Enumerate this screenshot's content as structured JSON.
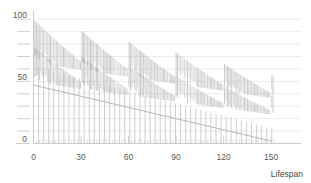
{
  "chart_data": {
    "type": "bar",
    "title": "",
    "subtitle": "",
    "xlabel": "Lifespan",
    "ylabel": "",
    "xlim": [
      0,
      160
    ],
    "ylim": [
      0,
      105
    ],
    "grid": true,
    "grid_axis": "y",
    "legend": false,
    "legend_position": "none",
    "annotations": [],
    "x_ticks_major": [
      0,
      30,
      60,
      90,
      120,
      150
    ],
    "x_tick_labels": [
      "0",
      "30",
      "60",
      "90",
      "120",
      "150"
    ],
    "x_ticks_minor_step": 2,
    "y_ticks_major": [
      0,
      50,
      100
    ],
    "y_tick_labels": [
      "0",
      "50",
      "100"
    ],
    "y_ticks_minor": [
      10,
      20,
      30,
      40,
      60,
      70,
      80,
      90
    ],
    "y_gridline_step": 10,
    "colors": {
      "bar": "#b9b9bd",
      "bar_dense": "#a9a9ae",
      "trend_line": "#b0b0b4",
      "gridline": "#e4e4e8",
      "axis": "#c8c8cc",
      "tick_label": "#5a5a5a",
      "axis_title": "#4a4a4a",
      "background": "#ffffff"
    },
    "series": [
      {
        "name": "upper-band",
        "kind": "vertical-sticks",
        "description": "Dense sawtooth band of vertical sticks with tops declining from 100 toward 55 across the lifespan axis, resetting every 30 units.",
        "sawtooth_period": 30,
        "top_start": 100,
        "top_end": 55,
        "baseline_start": 72,
        "baseline_end": 40,
        "stick_step": 0.9
      },
      {
        "name": "middle-band",
        "kind": "vertical-sticks",
        "description": "Second dense sawtooth band of vertical sticks with tops declining from 78 toward 38, resetting every 30 units.",
        "sawtooth_period": 30,
        "top_start": 78,
        "top_end": 38,
        "baseline_start": 55,
        "baseline_end": 26,
        "stick_step": 0.9
      },
      {
        "name": "lower-sparse-bars",
        "kind": "vertical-sticks",
        "description": "Widely spaced vertical bars rising from the zero baseline, tops declining from about 62 at x=0 to about 12 at x=150.",
        "spacing": 3.2,
        "top_start": 62,
        "top_end": 12,
        "baseline": 0
      },
      {
        "name": "trend-line",
        "kind": "line",
        "description": "Straight descending reference line.",
        "points": [
          [
            0,
            47
          ],
          [
            150,
            2
          ]
        ]
      }
    ]
  },
  "axes": {
    "x_axis_label": "Lifespan",
    "y_axis_label": ""
  }
}
